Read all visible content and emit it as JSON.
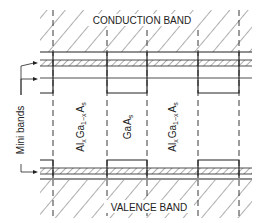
{
  "diagram": {
    "top_label": "CONDUCTION BAND",
    "bottom_label": "VALENCE BAND",
    "side_label": "Mini bands",
    "layers": [
      {
        "label_main": "Al",
        "sub1": "x",
        "mid": "Ga",
        "sub2": "1−x",
        "tail": "A",
        "sub3": "s"
      },
      {
        "label_main": "Ga",
        "tail": "A",
        "sub3": "s"
      },
      {
        "label_main": "Al",
        "sub1": "x",
        "mid": "Ga",
        "sub2": "1−x",
        "tail": "A",
        "sub3": "s"
      }
    ],
    "layer_text": [
      "AlxGa1−xAs",
      "GaAs",
      "AlxGa1−xAs"
    ],
    "colors": {
      "line": "#222222",
      "background": "#ffffff"
    }
  }
}
